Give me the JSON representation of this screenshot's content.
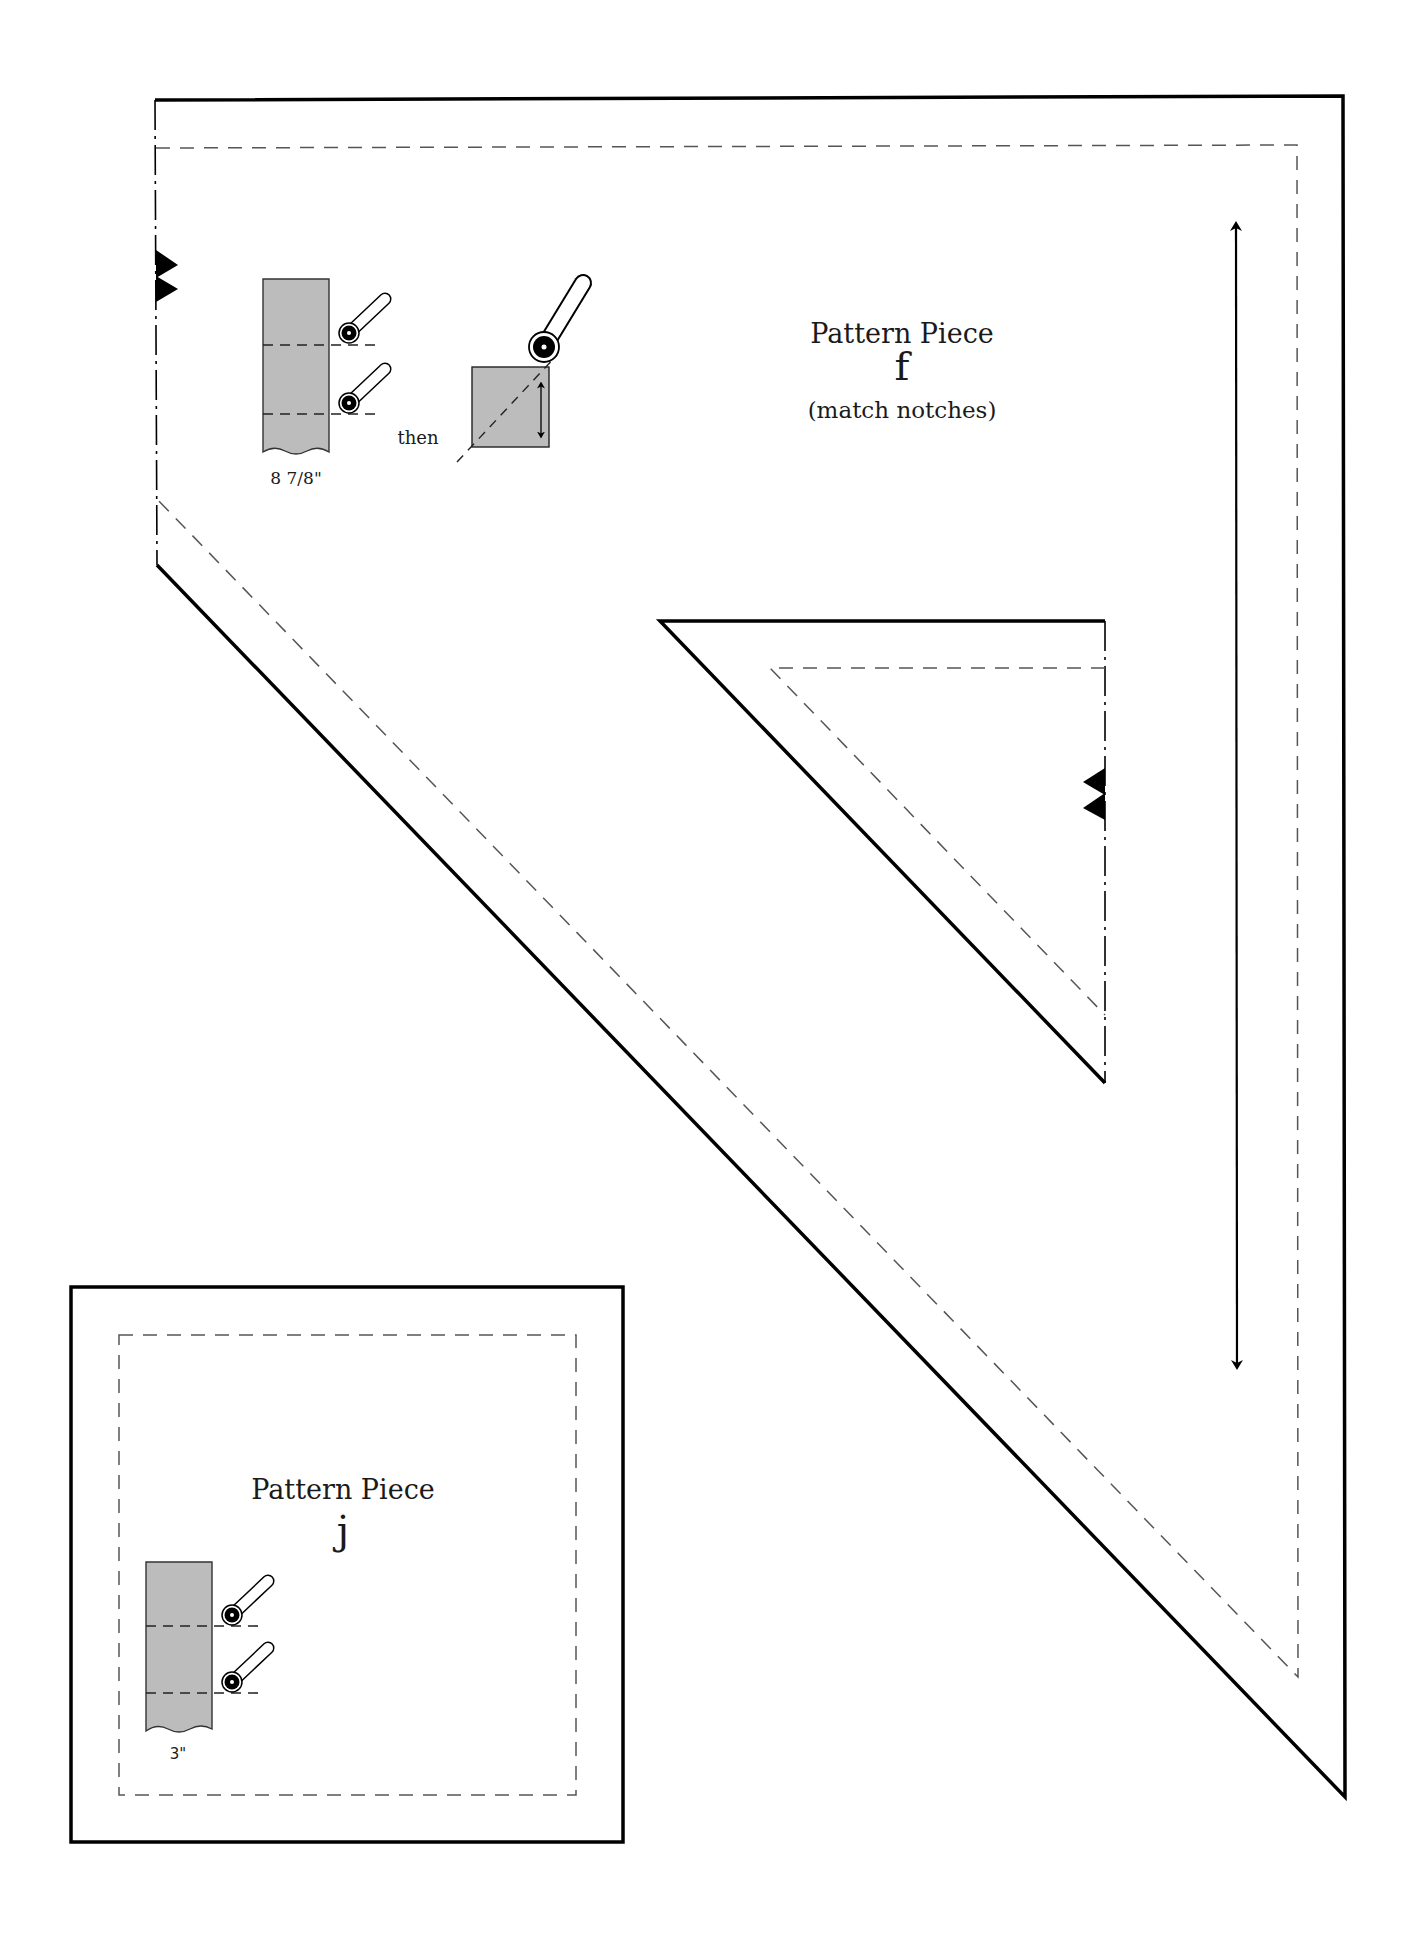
{
  "piece_f": {
    "title": "Pattern Piece",
    "letter": "f",
    "note": "(match notches)",
    "strip_measure": "8 7/8\"",
    "instruction_then": "then"
  },
  "piece_j": {
    "title": "Pattern Piece",
    "letter": "j",
    "strip_measure": "3\""
  },
  "colors": {
    "cut_line": "#000000",
    "seam_line": "#555555",
    "fabric_fill": "#bcbcbc"
  },
  "icons": {
    "notch": "notch-icon",
    "rotary_cutter": "rotary-cutter-icon",
    "grainline_arrow": "grainline-arrow-icon"
  }
}
